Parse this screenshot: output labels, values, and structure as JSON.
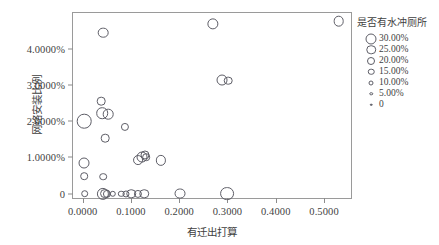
{
  "chart_data": {
    "type": "scatter",
    "title": "",
    "xlabel": "有迁出打算",
    "ylabel": "网络安装比例",
    "xlim": [
      -0.02,
      0.56
    ],
    "ylim": [
      -0.0018,
      0.05
    ],
    "grid": false,
    "legend_position": "right",
    "x_ticks": [
      "0.0000",
      "0.1000",
      "0.2000",
      "0.3000",
      "0.4000",
      "0.5000"
    ],
    "x_tick_values": [
      0.0,
      0.1,
      0.2,
      0.3,
      0.4,
      0.5
    ],
    "y_ticks": [
      "0",
      "1.0000%",
      "2.0000%",
      "3.0000%",
      "4.0000%"
    ],
    "y_tick_values": [
      0.0,
      0.01,
      0.02,
      0.03,
      0.04
    ],
    "size_legend": {
      "title": "是否有水冲厕所",
      "entries": [
        {
          "label": "30.00%",
          "value": 0.3,
          "px": 11
        },
        {
          "label": "25.00%",
          "value": 0.25,
          "px": 9.5
        },
        {
          "label": "20.00%",
          "value": 0.2,
          "px": 8
        },
        {
          "label": "15.00%",
          "value": 0.15,
          "px": 6.5
        },
        {
          "label": "10.00%",
          "value": 0.1,
          "px": 5
        },
        {
          "label": "5.00%",
          "value": 0.05,
          "px": 3.5
        },
        {
          "label": "0",
          "value": 0.0,
          "px": 2.5
        }
      ]
    },
    "points": [
      {
        "x": 0.003,
        "y": 0.02,
        "size": 0.26
      },
      {
        "x": 0.003,
        "y": 0.0085,
        "size": 0.13
      },
      {
        "x": 0.0035,
        "y": 0.0048,
        "size": 0.05
      },
      {
        "x": 0.004,
        "y": 0.0,
        "size": 0.05
      },
      {
        "x": 0.042,
        "y": 0.0445,
        "size": 0.12
      },
      {
        "x": 0.038,
        "y": 0.0255,
        "size": 0.07
      },
      {
        "x": 0.04,
        "y": 0.0222,
        "size": 0.15
      },
      {
        "x": 0.053,
        "y": 0.022,
        "size": 0.12
      },
      {
        "x": 0.047,
        "y": 0.0153,
        "size": 0.07
      },
      {
        "x": 0.043,
        "y": 0.0047,
        "size": 0.05
      },
      {
        "x": 0.042,
        "y": 0.0,
        "size": 0.17
      },
      {
        "x": 0.047,
        "y": 0.0,
        "size": 0.1
      },
      {
        "x": 0.0495,
        "y": 0.0,
        "size": 0.06
      },
      {
        "x": 0.062,
        "y": 0.0,
        "size": 0.03
      },
      {
        "x": 0.08,
        "y": 0.0,
        "size": 0.03
      },
      {
        "x": 0.09,
        "y": 0.0,
        "size": 0.04
      },
      {
        "x": 0.101,
        "y": 0.0,
        "size": 0.09
      },
      {
        "x": 0.114,
        "y": 0.0,
        "size": 0.06
      },
      {
        "x": 0.128,
        "y": 0.0,
        "size": 0.09
      },
      {
        "x": 0.088,
        "y": 0.0185,
        "size": 0.06
      },
      {
        "x": 0.115,
        "y": 0.0092,
        "size": 0.1
      },
      {
        "x": 0.123,
        "y": 0.01,
        "size": 0.13
      },
      {
        "x": 0.129,
        "y": 0.0108,
        "size": 0.08
      },
      {
        "x": 0.131,
        "y": 0.01,
        "size": 0.05
      },
      {
        "x": 0.162,
        "y": 0.0092,
        "size": 0.11
      },
      {
        "x": 0.202,
        "y": 0.0,
        "size": 0.13
      },
      {
        "x": 0.27,
        "y": 0.047,
        "size": 0.14
      },
      {
        "x": 0.288,
        "y": 0.0315,
        "size": 0.13
      },
      {
        "x": 0.301,
        "y": 0.0312,
        "size": 0.07
      },
      {
        "x": 0.3,
        "y": 0.0,
        "size": 0.23
      },
      {
        "x": 0.53,
        "y": 0.0478,
        "size": 0.12
      }
    ]
  }
}
